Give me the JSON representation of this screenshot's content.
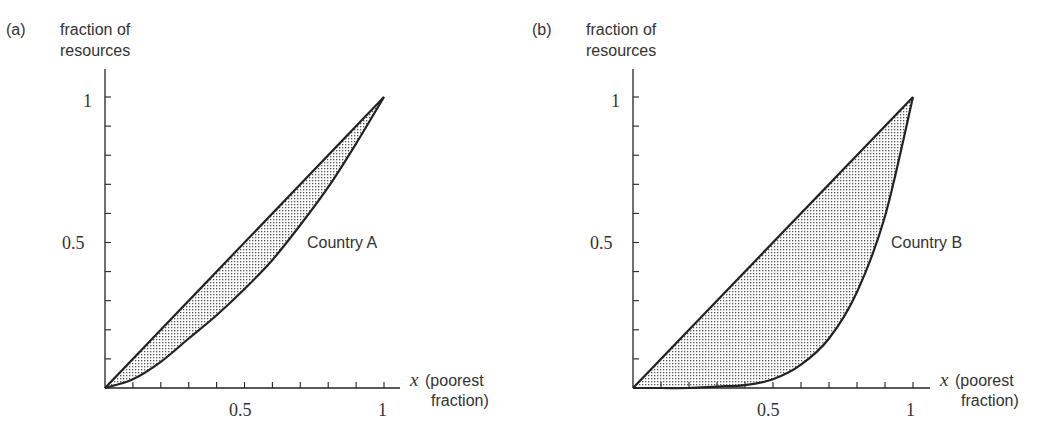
{
  "chart_data": [
    {
      "type": "area",
      "panel_label": "(a)",
      "ylabel": [
        "fraction of",
        "resources"
      ],
      "xlabel_var": "x",
      "xlabel": [
        "(poorest",
        "fraction)"
      ],
      "xlim": [
        0,
        1
      ],
      "ylim": [
        0,
        1
      ],
      "xticks_labeled": [
        "0.5",
        "1"
      ],
      "yticks_labeled": [
        "0.5",
        "1"
      ],
      "minor_tick_step": 0.1,
      "grid": false,
      "curve_label": "Country A",
      "series": [
        {
          "name": "equality line",
          "x": [
            0,
            1
          ],
          "y": [
            0,
            1
          ]
        },
        {
          "name": "Country A",
          "x": [
            0,
            0.1,
            0.2,
            0.3,
            0.4,
            0.5,
            0.6,
            0.7,
            0.8,
            0.9,
            1.0
          ],
          "y": [
            0,
            0.03,
            0.09,
            0.17,
            0.25,
            0.34,
            0.44,
            0.56,
            0.69,
            0.84,
            1.0
          ]
        }
      ],
      "shaded_region": "between equality line and Country A curve"
    },
    {
      "type": "area",
      "panel_label": "(b)",
      "ylabel": [
        "fraction of",
        "resources"
      ],
      "xlabel_var": "x",
      "xlabel": [
        "(poorest",
        "fraction)"
      ],
      "xlim": [
        0,
        1
      ],
      "ylim": [
        0,
        1
      ],
      "xticks_labeled": [
        "0.5",
        "1"
      ],
      "yticks_labeled": [
        "0.5",
        "1"
      ],
      "minor_tick_step": 0.1,
      "grid": false,
      "curve_label": "Country B",
      "series": [
        {
          "name": "equality line",
          "x": [
            0,
            1
          ],
          "y": [
            0,
            1
          ]
        },
        {
          "name": "Country B",
          "x": [
            0,
            0.1,
            0.2,
            0.3,
            0.4,
            0.5,
            0.6,
            0.7,
            0.8,
            0.9,
            1.0
          ],
          "y": [
            0,
            0.0,
            0.0,
            0.005,
            0.01,
            0.03,
            0.08,
            0.17,
            0.33,
            0.59,
            1.0
          ]
        }
      ],
      "shaded_region": "between equality line and Country B curve"
    }
  ]
}
